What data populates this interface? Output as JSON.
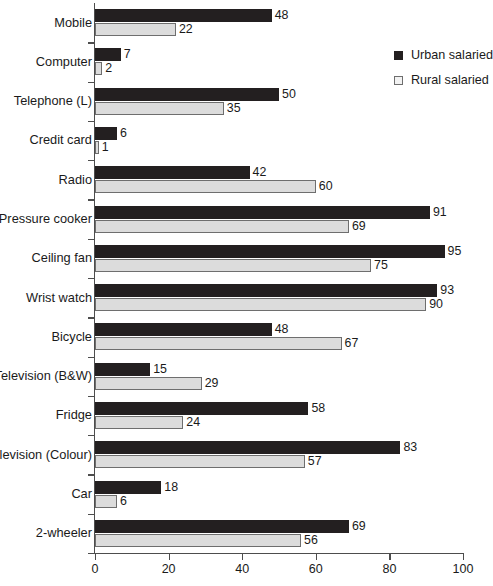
{
  "chart_data": {
    "type": "bar",
    "orientation": "horizontal",
    "title": "",
    "subtitle": "",
    "xlabel": "",
    "ylabel": "",
    "xlim": [
      0,
      100
    ],
    "xticks": [
      0,
      20,
      40,
      60,
      80,
      100
    ],
    "grid": false,
    "legend_position": "top-right",
    "categories": [
      "Mobile",
      "Computer",
      "Telephone (L)",
      "Credit card",
      "Radio",
      "Pressure cooker",
      "Ceiling fan",
      "Wrist watch",
      "Bicycle",
      "Television (B&W)",
      "Fridge",
      "Television (Colour)",
      "Car",
      "2-wheeler"
    ],
    "series": [
      {
        "name": "Urban salaried",
        "color": "#231f20",
        "values": [
          48,
          7,
          50,
          6,
          42,
          91,
          95,
          93,
          48,
          15,
          58,
          83,
          18,
          69
        ]
      },
      {
        "name": "Rural salaried",
        "color": "#dcdcdc",
        "values": [
          22,
          2,
          35,
          1,
          60,
          69,
          75,
          90,
          67,
          29,
          24,
          57,
          6,
          56
        ]
      }
    ]
  },
  "legend": {
    "items": [
      {
        "label": "Urban salaried",
        "swatch": "filled-square-dark"
      },
      {
        "label": "Rural salaried",
        "swatch": "outlined-square-light"
      }
    ]
  },
  "axis": {
    "x_tick_labels": [
      "0",
      "20",
      "40",
      "60",
      "80",
      "100"
    ]
  }
}
